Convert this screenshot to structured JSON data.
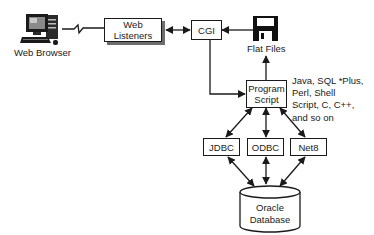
{
  "diagram": {
    "type": "architecture",
    "nodes": {
      "web_browser": {
        "label": "Web Browser",
        "icon": "desktop-computer-icon"
      },
      "web_listeners": {
        "label": "Web Listeners"
      },
      "cgi": {
        "label": "CGI"
      },
      "flat_files": {
        "label": "Flat Files",
        "icon": "floppy-disk-icon"
      },
      "program_script": {
        "label_line1": "Program",
        "label_line2": "Script"
      },
      "jdbc": {
        "label": "JDBC"
      },
      "odbc": {
        "label": "ODBC"
      },
      "net8": {
        "label": "Net8"
      },
      "oracle_db": {
        "label_line1": "Oracle",
        "label_line2": "Database",
        "icon": "database-cylinder-icon"
      }
    },
    "script_languages": {
      "lines": [
        "Java, SQL *Plus,",
        "Perl, Shell",
        "Script, C, C++,",
        "and so on"
      ]
    },
    "edges": [
      {
        "from": "Web Browser",
        "to": "Web Listeners",
        "style": "zigzag-network-link"
      },
      {
        "from": "Web Listeners",
        "to": "CGI",
        "style": "bidirectional-arrow"
      },
      {
        "from": "Flat Files",
        "to": "CGI",
        "style": "arrow"
      },
      {
        "from": "CGI",
        "to": "Program Script",
        "style": "elbow-arrow"
      },
      {
        "from": "Program Script",
        "to": "Flat Files",
        "style": "arrow"
      },
      {
        "from": "Program Script",
        "to": "JDBC",
        "style": "bidirectional-arrow"
      },
      {
        "from": "Program Script",
        "to": "ODBC",
        "style": "bidirectional-arrow"
      },
      {
        "from": "Program Script",
        "to": "Net8",
        "style": "bidirectional-arrow"
      },
      {
        "from": "JDBC",
        "to": "Oracle Database",
        "style": "bidirectional-arrow"
      },
      {
        "from": "ODBC",
        "to": "Oracle Database",
        "style": "bidirectional-arrow"
      },
      {
        "from": "Net8",
        "to": "Oracle Database",
        "style": "bidirectional-arrow"
      }
    ]
  }
}
